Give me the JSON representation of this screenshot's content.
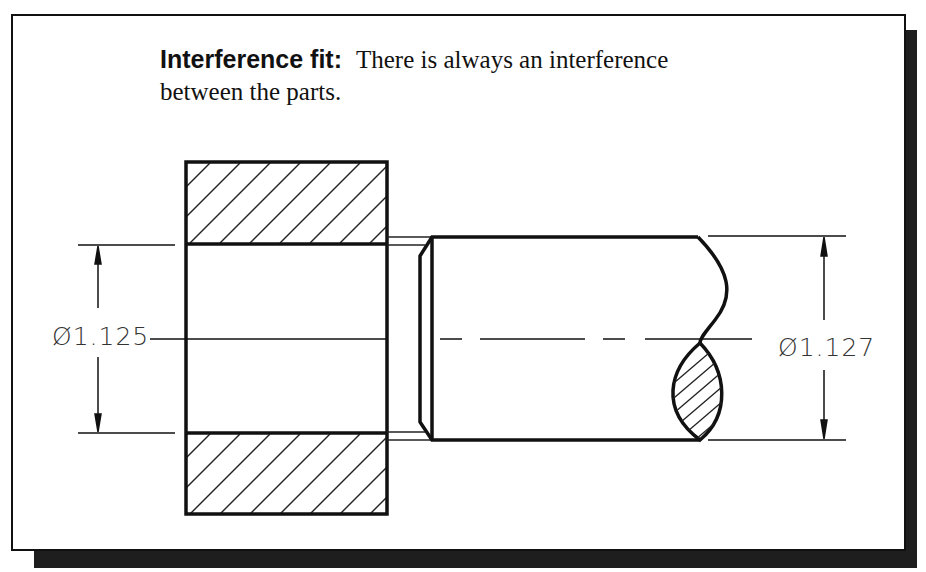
{
  "caption": {
    "term": "Interference fit:",
    "description_line1": "There is always an interference",
    "description_line2": "between the parts."
  },
  "dimensions": {
    "hole_diameter": "Ø1.125",
    "shaft_diameter": "Ø1.127"
  },
  "parts": {
    "hub": "hole part (sectioned, hatched)",
    "shaft": "shaft with chamfered end and break line"
  },
  "colors": {
    "line": "#111111",
    "dim_text": "#333333",
    "shadow": "#1e1e1e",
    "background": "#ffffff"
  }
}
